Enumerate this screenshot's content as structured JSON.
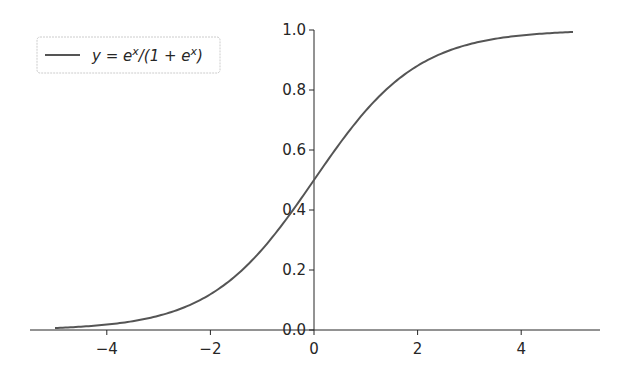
{
  "chart_data": {
    "type": "line",
    "title": "",
    "xlabel": "",
    "ylabel": "",
    "xlim": [
      -5.4,
      5.6
    ],
    "ylim": [
      0,
      1.0
    ],
    "grid": false,
    "legend_position": "upper left",
    "spines": "centered (y-axis at x=0, x-axis at y=0)",
    "x_ticks": [
      -4,
      -2,
      0,
      2,
      4
    ],
    "x_tick_labels": [
      "−4",
      "−2",
      "0",
      "2",
      "4"
    ],
    "y_ticks": [
      0.0,
      0.2,
      0.4,
      0.6,
      0.8,
      1.0
    ],
    "y_tick_labels": [
      "0.0",
      "0.2",
      "0.4",
      "0.6",
      "0.8",
      "1.0"
    ],
    "series": [
      {
        "name": "y = e^x/(1 + e^x)",
        "color": "#555555",
        "x": [
          -5,
          -4,
          -3,
          -2,
          -1,
          0,
          1,
          2,
          3,
          4,
          5
        ],
        "values": [
          0.0067,
          0.018,
          0.047,
          0.119,
          0.269,
          0.5,
          0.731,
          0.881,
          0.953,
          0.982,
          0.9933
        ]
      }
    ]
  },
  "legend": {
    "label_prefix": "y = e",
    "sup1": "x",
    "label_middle": "/(1 + e",
    "sup2": "x",
    "label_suffix": ")"
  },
  "colors": {
    "line": "#555555",
    "axis": "#262626",
    "legend_border": "#cccccc"
  }
}
